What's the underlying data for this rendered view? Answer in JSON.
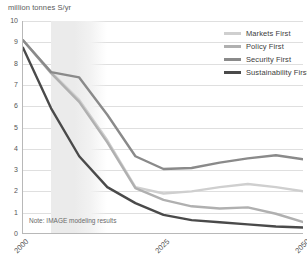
{
  "axis_title": "million tonnes S/yr",
  "note": "Note: IMAGE modeling results",
  "legend": {
    "items": [
      {
        "label": "Markets First",
        "color": "#cfcfcf"
      },
      {
        "label": "Policy First",
        "color": "#b0b0b0"
      },
      {
        "label": "Security First",
        "color": "#8a8a8a"
      },
      {
        "label": "Sustainability First",
        "color": "#4a4a4a"
      }
    ]
  },
  "chart_data": {
    "type": "line",
    "title": "",
    "xlabel": "",
    "ylabel": "million tonnes S/yr",
    "xlim": [
      2000,
      2050
    ],
    "ylim": [
      0,
      10
    ],
    "grid": true,
    "legend_position": "top-right",
    "ytick_labels": [
      "10",
      "9",
      "8",
      "7",
      "6",
      "5",
      "4",
      "3",
      "2",
      "1",
      "0"
    ],
    "ytick_values": [
      10,
      9,
      8,
      7,
      6,
      5,
      4,
      3,
      2,
      1,
      0
    ],
    "xtick_labels": [
      "2000",
      "2025",
      "2050"
    ],
    "xtick_values": [
      2000,
      2025,
      2050
    ],
    "shaded_band": {
      "from": 2005,
      "to": 2015,
      "color": "#ebebeb",
      "fade": true
    },
    "annotations": [
      {
        "text": "Note: IMAGE modeling results",
        "x": 2002,
        "y": 0.45
      }
    ],
    "x": [
      2000,
      2005,
      2010,
      2015,
      2020,
      2025,
      2030,
      2035,
      2040,
      2045,
      2050
    ],
    "series": [
      {
        "name": "Markets First",
        "color": "#cfcfcf",
        "values": [
          9.1,
          7.6,
          6.3,
          4.4,
          2.2,
          1.9,
          2.0,
          2.2,
          2.35,
          2.2,
          2.0
        ]
      },
      {
        "name": "Policy First",
        "color": "#b0b0b0",
        "values": [
          9.1,
          7.55,
          6.2,
          4.3,
          2.15,
          1.6,
          1.3,
          1.2,
          1.25,
          0.95,
          0.55
        ]
      },
      {
        "name": "Security First",
        "color": "#8a8a8a",
        "values": [
          9.1,
          7.6,
          7.35,
          5.6,
          3.65,
          3.05,
          3.1,
          3.35,
          3.55,
          3.7,
          3.5
        ]
      },
      {
        "name": "Sustainability First",
        "color": "#4a4a4a",
        "values": [
          8.75,
          5.9,
          3.65,
          2.2,
          1.45,
          0.9,
          0.65,
          0.55,
          0.45,
          0.35,
          0.3
        ]
      }
    ]
  }
}
